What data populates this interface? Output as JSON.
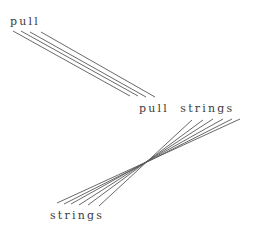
{
  "canvas": {
    "width": 255,
    "height": 236,
    "background": "#ffffff"
  },
  "style": {
    "line_color": "#585858",
    "line_width": 0.9,
    "text_color": "#3c3c3c",
    "font_size_px": 11,
    "letter_spacing_px": 2.2
  },
  "labels": {
    "top": "pull",
    "middle": "pull  strings",
    "bottom": "strings"
  },
  "diagram_data": {
    "type": "diagram",
    "description": "Two bundles of parallel diagonal lines resembling pulled strings connecting three text labels",
    "nodes": [
      {
        "id": "top",
        "text": "pull",
        "x": 10,
        "y": 16
      },
      {
        "id": "middle",
        "text": "pull  strings",
        "x": 139,
        "y": 103
      },
      {
        "id": "bottom",
        "text": "strings",
        "x": 50,
        "y": 210
      }
    ],
    "line_groups": [
      {
        "id": "group-upper",
        "count": 4,
        "direction": "down-right",
        "from_node": "top",
        "to_node": "middle",
        "segments": [
          {
            "x1": 13,
            "y1": 31,
            "x2": 130,
            "y2": 96
          },
          {
            "x1": 21,
            "y1": 31,
            "x2": 138,
            "y2": 96
          },
          {
            "x1": 30,
            "y1": 32,
            "x2": 146,
            "y2": 97
          },
          {
            "x1": 41,
            "y1": 32,
            "x2": 155,
            "y2": 97
          }
        ]
      },
      {
        "id": "group-lower",
        "count": 6,
        "direction": "down-left",
        "from_node": "middle",
        "to_node": "bottom",
        "segments": [
          {
            "x1": 240,
            "y1": 119,
            "x2": 57,
            "y2": 203
          },
          {
            "x1": 232,
            "y1": 119,
            "x2": 64,
            "y2": 204
          },
          {
            "x1": 223,
            "y1": 119,
            "x2": 71,
            "y2": 204
          },
          {
            "x1": 213,
            "y1": 119,
            "x2": 79,
            "y2": 205
          },
          {
            "x1": 203,
            "y1": 120,
            "x2": 88,
            "y2": 205
          },
          {
            "x1": 192,
            "y1": 120,
            "x2": 99,
            "y2": 206
          }
        ]
      }
    ]
  }
}
